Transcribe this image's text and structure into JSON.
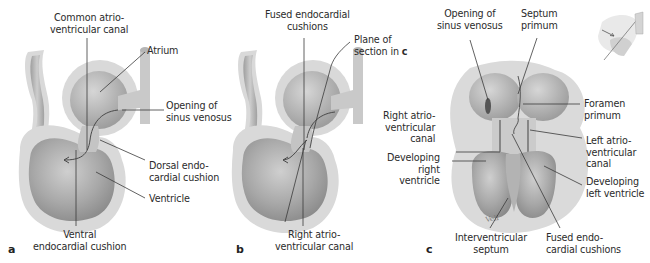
{
  "figure": {
    "panels": [
      {
        "id": "a",
        "panel_letter": "a",
        "labels": {
          "common_av_canal": "Common atrio-\nventricular canal",
          "atrium": "Atrium",
          "opening_sinus": "Opening of\nsinus venosus",
          "dorsal_cushion": "Dorsal endo-\ncardial cushion",
          "ventricle": "Ventricle",
          "ventral_cushion": "Ventral\nendocardial cushion"
        }
      },
      {
        "id": "b",
        "panel_letter": "b",
        "labels": {
          "fused_cushions": "Fused endocardial\ncushions",
          "plane_of_section": "Plane of\nsection in ",
          "plane_ref": "c",
          "right_av_canal": "Right atrio-\nventricular canal"
        }
      },
      {
        "id": "c",
        "panel_letter": "c",
        "labels": {
          "opening_sinus": "Opening of\nsinus venosus",
          "septum_primum": "Septum\nprimum",
          "foramen_primum": "Foramen\nprimum",
          "right_av_canal": "Right atrio-\nventricular\ncanal",
          "left_av_canal": "Left atrio-\nventricular\ncanal",
          "dev_right_ventricle": "Developing\nright\nventricle",
          "dev_left_ventricle": "Developing\nleft ventricle",
          "interventricular_septum": "Interventricular\nseptum",
          "fused_cushions": "Fused endo-\ncardial cushions"
        }
      }
    ],
    "colors": {
      "outer_wall": "#d9d9d9",
      "inner_chamber": "#a9a9a9",
      "leader_line": "#3a3a3a",
      "text": "#2b2b2b"
    }
  }
}
